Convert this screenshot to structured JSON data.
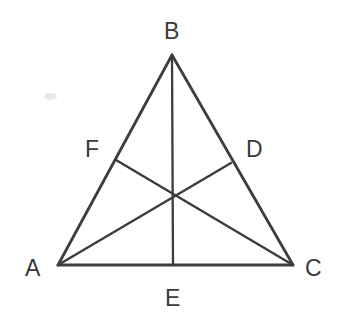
{
  "figure": {
    "type": "geometry-diagram",
    "background_color": "#ffffff",
    "stroke_color": "#3d3d3d",
    "label_color": "#3a3a3a",
    "stroke_width": 2.6
  },
  "points": {
    "A": {
      "label": "A",
      "x": 58,
      "y": 265,
      "role": "vertex"
    },
    "B": {
      "label": "B",
      "x": 172,
      "y": 55,
      "role": "vertex"
    },
    "C": {
      "label": "C",
      "x": 293,
      "y": 265,
      "role": "vertex"
    },
    "D": {
      "label": "D",
      "x": 231,
      "y": 163,
      "role": "midpoint-of-BC"
    },
    "E": {
      "label": "E",
      "x": 173,
      "y": 265,
      "role": "midpoint-of-AC"
    },
    "F": {
      "label": "F",
      "x": 116,
      "y": 160,
      "role": "midpoint-of-AB"
    },
    "G": {
      "label": "",
      "x": 174,
      "y": 196,
      "role": "centroid"
    }
  },
  "label_positions": {
    "A": {
      "x": 25,
      "y": 257
    },
    "B": {
      "x": 164,
      "y": 20
    },
    "C": {
      "x": 305,
      "y": 257
    },
    "D": {
      "x": 246,
      "y": 138
    },
    "E": {
      "x": 165,
      "y": 287
    },
    "F": {
      "x": 85,
      "y": 138
    }
  },
  "segments": [
    {
      "name": "side-AB",
      "from": "A",
      "to": "B",
      "kind": "triangle-side"
    },
    {
      "name": "side-BC",
      "from": "B",
      "to": "C",
      "kind": "triangle-side"
    },
    {
      "name": "side-AC",
      "from": "A",
      "to": "C",
      "kind": "triangle-side"
    },
    {
      "name": "median-AD",
      "from": "A",
      "to": "D",
      "kind": "median"
    },
    {
      "name": "median-BE",
      "from": "B",
      "to": "E",
      "kind": "median"
    },
    {
      "name": "median-CF",
      "from": "C",
      "to": "F",
      "kind": "median"
    }
  ]
}
